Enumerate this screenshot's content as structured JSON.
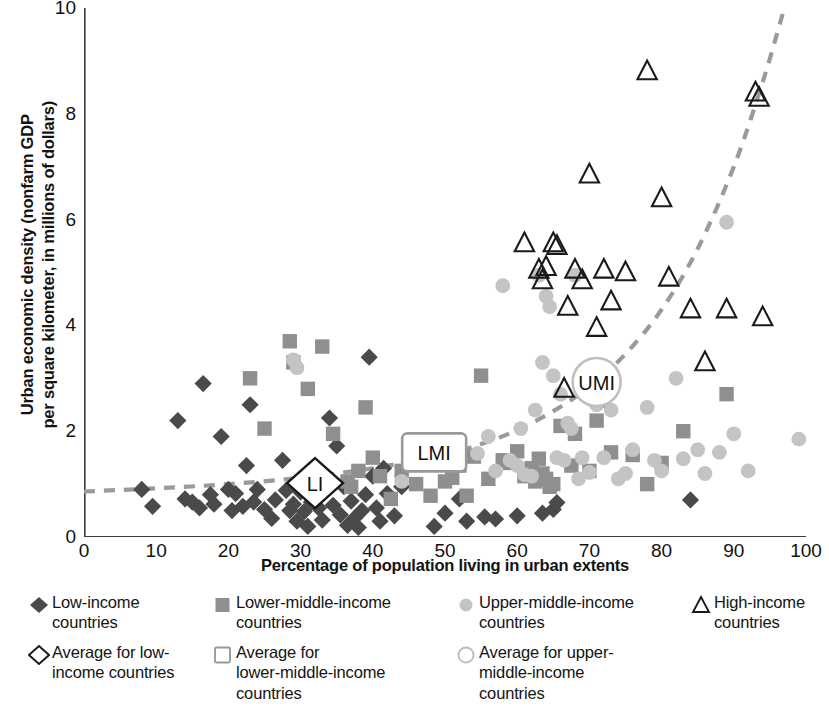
{
  "chart_data": {
    "type": "scatter",
    "title": "",
    "xlabel": "Percentage of population living in urban extents",
    "ylabel": "Urban economic density (nonfarm GDP per square kilometer, in millions of dollars)",
    "ylabel_line1": "Urban economic density (nonfarm GDP",
    "ylabel_line2": "per square kilometer, in millions of dollars)",
    "xlim": [
      0,
      100
    ],
    "ylim": [
      0,
      10
    ],
    "xticks": [
      0,
      10,
      20,
      30,
      40,
      50,
      60,
      70,
      80,
      90,
      100
    ],
    "yticks": [
      0,
      2,
      4,
      6,
      8,
      10
    ],
    "grid": false,
    "legend_position": "below",
    "colors": {
      "low_income": "#4a4a4a",
      "lower_middle_income": "#8f8f8f",
      "upper_middle_income": "#c4c4c4",
      "high_income_outline": "#1a1a1a",
      "trend_line": "#9a9a9a",
      "axis": "#3c3c3c"
    },
    "trend_line": {
      "style": "dashed",
      "color": "#9a9a9a",
      "points": [
        [
          0,
          0.86
        ],
        [
          10,
          0.92
        ],
        [
          20,
          1.0
        ],
        [
          30,
          1.12
        ],
        [
          40,
          1.3
        ],
        [
          50,
          1.56
        ],
        [
          55,
          1.76
        ],
        [
          60,
          2.02
        ],
        [
          65,
          2.38
        ],
        [
          70,
          2.84
        ],
        [
          75,
          3.46
        ],
        [
          80,
          4.3
        ],
        [
          85,
          5.45
        ],
        [
          90,
          7.0
        ],
        [
          94,
          8.6
        ],
        [
          97,
          10.0
        ]
      ]
    },
    "series": [
      {
        "name": "Low-income countries",
        "marker": "filled-diamond",
        "color": "#4a4a4a",
        "points": [
          [
            8,
            0.9
          ],
          [
            9.5,
            0.58
          ],
          [
            13,
            2.2
          ],
          [
            14,
            0.72
          ],
          [
            15,
            0.66
          ],
          [
            16,
            0.55
          ],
          [
            16.5,
            2.9
          ],
          [
            17.5,
            0.8
          ],
          [
            18,
            0.62
          ],
          [
            19,
            1.9
          ],
          [
            20,
            0.9
          ],
          [
            20.5,
            0.5
          ],
          [
            21,
            0.82
          ],
          [
            22,
            0.58
          ],
          [
            22.5,
            1.35
          ],
          [
            23,
            2.5
          ],
          [
            23.5,
            0.66
          ],
          [
            24,
            0.9
          ],
          [
            25,
            0.52
          ],
          [
            26,
            0.35
          ],
          [
            26.5,
            0.7
          ],
          [
            27.5,
            1.45
          ],
          [
            28,
            0.88
          ],
          [
            28.5,
            0.5
          ],
          [
            29,
            0.62
          ],
          [
            29.5,
            0.3
          ],
          [
            30,
            0.85
          ],
          [
            30.5,
            0.48
          ],
          [
            31,
            0.2
          ],
          [
            31.5,
            0.66
          ],
          [
            32,
            1.05
          ],
          [
            32.5,
            0.55
          ],
          [
            33,
            0.32
          ],
          [
            33.5,
            0.88
          ],
          [
            34,
            2.25
          ],
          [
            34.5,
            0.6
          ],
          [
            35,
            1.72
          ],
          [
            35.5,
            0.42
          ],
          [
            36,
            0.95
          ],
          [
            36.5,
            0.22
          ],
          [
            37,
            0.68
          ],
          [
            37.5,
            0.36
          ],
          [
            38,
            0.18
          ],
          [
            38.5,
            0.5
          ],
          [
            39,
            0.8
          ],
          [
            39.5,
            3.4
          ],
          [
            40,
            1.15
          ],
          [
            40.5,
            0.55
          ],
          [
            41,
            0.3
          ],
          [
            41.5,
            1.3
          ],
          [
            42,
            0.82
          ],
          [
            43,
            0.4
          ],
          [
            44,
            0.95
          ],
          [
            48.5,
            0.2
          ],
          [
            50,
            0.45
          ],
          [
            52,
            0.72
          ],
          [
            53,
            0.3
          ],
          [
            55.5,
            0.38
          ],
          [
            57,
            0.34
          ],
          [
            60,
            0.4
          ],
          [
            63.5,
            0.45
          ],
          [
            65,
            0.52
          ],
          [
            65.5,
            0.65
          ],
          [
            72,
            2.6
          ],
          [
            84,
            0.7
          ]
        ]
      },
      {
        "name": "Lower-middle-income countries",
        "marker": "filled-square",
        "color": "#8f8f8f",
        "points": [
          [
            23,
            3.0
          ],
          [
            25,
            2.05
          ],
          [
            28.5,
            3.7
          ],
          [
            29,
            3.3
          ],
          [
            31,
            2.8
          ],
          [
            33,
            3.6
          ],
          [
            34.5,
            1.95
          ],
          [
            36.5,
            1.05
          ],
          [
            37,
            0.95
          ],
          [
            38,
            1.25
          ],
          [
            39,
            2.45
          ],
          [
            40,
            1.5
          ],
          [
            41,
            1.15
          ],
          [
            42.5,
            0.72
          ],
          [
            44,
            1.25
          ],
          [
            45,
            1.45
          ],
          [
            46,
            1.0
          ],
          [
            47,
            1.42
          ],
          [
            48,
            0.78
          ],
          [
            49,
            1.38
          ],
          [
            50,
            1.05
          ],
          [
            51,
            1.12
          ],
          [
            52,
            1.35
          ],
          [
            53,
            0.78
          ],
          [
            54,
            1.52
          ],
          [
            55,
            3.05
          ],
          [
            56,
            1.1
          ],
          [
            58,
            1.45
          ],
          [
            59,
            1.4
          ],
          [
            60,
            1.62
          ],
          [
            61,
            1.15
          ],
          [
            62,
            1.3
          ],
          [
            62.5,
            1.05
          ],
          [
            63,
            1.48
          ],
          [
            63.5,
            1.2
          ],
          [
            64,
            1.1
          ],
          [
            64.5,
            0.95
          ],
          [
            65,
            1.0
          ],
          [
            66,
            2.1
          ],
          [
            67.5,
            1.35
          ],
          [
            68,
            1.95
          ],
          [
            70,
            1.25
          ],
          [
            71,
            2.2
          ],
          [
            73,
            1.6
          ],
          [
            76,
            1.55
          ],
          [
            78,
            1.0
          ],
          [
            80,
            1.4
          ],
          [
            83,
            2.0
          ],
          [
            89,
            2.7
          ]
        ]
      },
      {
        "name": "Upper-middle-income countries",
        "marker": "filled-circle",
        "color": "#c4c4c4",
        "points": [
          [
            29,
            3.35
          ],
          [
            29.5,
            3.2
          ],
          [
            44,
            1.05
          ],
          [
            50,
            1.55
          ],
          [
            52,
            1.6
          ],
          [
            54.5,
            1.58
          ],
          [
            56,
            1.9
          ],
          [
            57,
            1.25
          ],
          [
            58,
            4.75
          ],
          [
            59,
            1.45
          ],
          [
            60,
            1.35
          ],
          [
            60.5,
            2.05
          ],
          [
            61,
            1.18
          ],
          [
            62,
            1.15
          ],
          [
            62.5,
            2.4
          ],
          [
            63,
            4.95
          ],
          [
            63.5,
            3.3
          ],
          [
            64,
            4.55
          ],
          [
            64.5,
            4.35
          ],
          [
            65,
            3.05
          ],
          [
            65.5,
            1.5
          ],
          [
            66,
            2.7
          ],
          [
            66.5,
            1.45
          ],
          [
            67,
            2.15
          ],
          [
            67.5,
            2.05
          ],
          [
            68,
            4.95
          ],
          [
            68.5,
            1.1
          ],
          [
            69,
            1.5
          ],
          [
            70,
            1.22
          ],
          [
            71,
            2.5
          ],
          [
            72,
            1.5
          ],
          [
            73,
            2.4
          ],
          [
            74,
            1.1
          ],
          [
            75,
            1.2
          ],
          [
            76,
            1.65
          ],
          [
            78,
            2.45
          ],
          [
            79,
            1.45
          ],
          [
            80,
            1.25
          ],
          [
            82,
            3.0
          ],
          [
            83,
            1.48
          ],
          [
            85,
            1.65
          ],
          [
            86,
            1.2
          ],
          [
            88,
            1.6
          ],
          [
            89,
            5.95
          ],
          [
            90,
            1.95
          ],
          [
            92,
            1.25
          ],
          [
            99,
            1.85
          ]
        ]
      },
      {
        "name": "High-income countries",
        "marker": "open-triangle",
        "color": "#1a1a1a",
        "points": [
          [
            61,
            5.55
          ],
          [
            63,
            5.05
          ],
          [
            63.5,
            4.85
          ],
          [
            64,
            5.1
          ],
          [
            65,
            5.55
          ],
          [
            65.5,
            5.5
          ],
          [
            66.5,
            2.8
          ],
          [
            67,
            4.35
          ],
          [
            68,
            5.05
          ],
          [
            69,
            4.85
          ],
          [
            70,
            6.85
          ],
          [
            71,
            3.95
          ],
          [
            72,
            5.05
          ],
          [
            73,
            4.45
          ],
          [
            75,
            5.0
          ],
          [
            78,
            8.8
          ],
          [
            80,
            6.4
          ],
          [
            81,
            4.9
          ],
          [
            84,
            4.3
          ],
          [
            86,
            3.3
          ],
          [
            89,
            4.3
          ],
          [
            93,
            8.4
          ],
          [
            93.5,
            8.3
          ],
          [
            94,
            4.15
          ]
        ]
      },
      {
        "name": "Average for low-income countries",
        "marker": "open-diamond",
        "color": "#1a1a1a",
        "points": [
          [
            32,
            1.02
          ]
        ],
        "label": "LI"
      },
      {
        "name": "Average for lower-middle-income countries",
        "marker": "open-square",
        "color": "#9a9a9a",
        "points": [
          [
            48.5,
            1.6
          ]
        ],
        "label": "LMI"
      },
      {
        "name": "Average for upper-middle-income countries",
        "marker": "open-circle",
        "color": "#c0c0c0",
        "points": [
          [
            71,
            2.93
          ]
        ],
        "label": "UMI"
      }
    ],
    "annotations": [
      {
        "text": "LI",
        "x": 32,
        "y": 1.02
      },
      {
        "text": "LMI",
        "x": 48.5,
        "y": 1.6
      },
      {
        "text": "UMI",
        "x": 71,
        "y": 2.93
      }
    ]
  },
  "legend": {
    "items": [
      {
        "marker": "filled-diamond",
        "label": "Low-income countries",
        "line1": "Low-income",
        "line2": "countries"
      },
      {
        "marker": "filled-square",
        "label": "Lower-middle-income countries",
        "line1": "Lower-middle-income",
        "line2": "countries"
      },
      {
        "marker": "filled-circle",
        "label": "Upper-middle-income countries",
        "line1": "Upper-middle-income",
        "line2": "countries"
      },
      {
        "marker": "open-triangle",
        "label": "High-income countries",
        "line1": "High-income",
        "line2": "countries"
      },
      {
        "marker": "open-diamond",
        "label": "Average for low-income countries",
        "line1": "Average for low-",
        "line2": "income countries"
      },
      {
        "marker": "open-square",
        "label": "Average for lower-middle-income countries",
        "line1": "Average for",
        "line2": "lower-middle-income",
        "line3": "countries"
      },
      {
        "marker": "open-circle",
        "label": "Average for upper-middle-income countries",
        "line1": "Average for upper-",
        "line2": "middle-income",
        "line3": "countries"
      }
    ]
  }
}
